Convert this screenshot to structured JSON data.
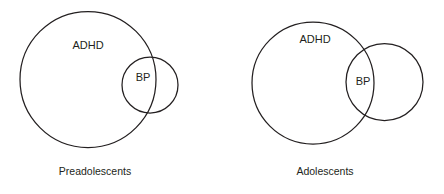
{
  "figure": {
    "type": "venn-diagram",
    "width": 444,
    "height": 194,
    "background_color": "#ffffff",
    "stroke_color": "#231f20",
    "text_color": "#231f20"
  },
  "chart_data": {
    "type": "diagram",
    "diagram_kind": "venn",
    "title": "",
    "panels": [
      {
        "id": "preadolescents",
        "caption": "Preadolescents",
        "caption_position": {
          "x": 95,
          "y": 172
        },
        "sets": [
          {
            "name": "ADHD",
            "label": "ADHD",
            "cx": 88,
            "cy": 79.5,
            "r": 68,
            "label_x": 88,
            "label_y": 46
          },
          {
            "name": "BP",
            "label": "BP",
            "cx": 150,
            "cy": 85,
            "r": 28,
            "label_x": 143,
            "label_y": 78
          }
        ],
        "relation": "BP nearly contained within ADHD; small crescent of BP extends outside ADHD on the right"
      },
      {
        "id": "adolescents",
        "caption": "Adolescents",
        "caption_position": {
          "x": 325,
          "y": 172
        },
        "sets": [
          {
            "name": "ADHD",
            "label": "ADHD",
            "cx": 313,
            "cy": 83,
            "r": 61,
            "label_x": 315,
            "label_y": 40
          },
          {
            "name": "BP",
            "label": "BP",
            "cx": 384.5,
            "cy": 82,
            "r": 38.5,
            "label_x": 363,
            "label_y": 82
          }
        ],
        "relation": "ADHD and BP partially overlap; roughly one third of BP lies inside ADHD"
      }
    ],
    "legend": [],
    "grid": false
  }
}
